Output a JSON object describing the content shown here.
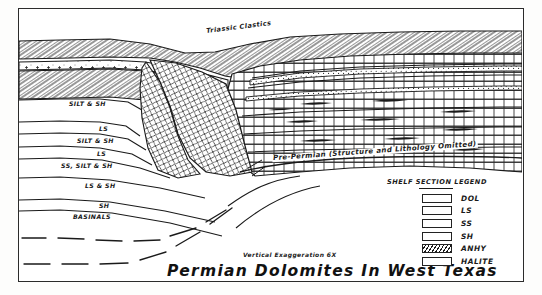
{
  "figure": {
    "title": "Permian Dolomites In West Texas",
    "vertical_exaggeration": "Vertical Exaggeration 6X"
  },
  "annotations": {
    "triassic": "Triassic Clastics",
    "pre_permian": "Pre-Permian (Structure and Lithology Omitted)"
  },
  "basin_units": [
    {
      "label": "SILT & SH",
      "x": 68,
      "y": 104
    },
    {
      "label": "LS",
      "x": 98,
      "y": 130
    },
    {
      "label": "SILT & SH",
      "x": 78,
      "y": 142
    },
    {
      "label": "LS",
      "x": 96,
      "y": 155
    },
    {
      "label": "SS, SILT & SH",
      "x": 62,
      "y": 166
    },
    {
      "label": "LS & SH",
      "x": 84,
      "y": 186
    },
    {
      "label": "SH",
      "x": 98,
      "y": 206
    },
    {
      "label": "BASINALS",
      "x": 74,
      "y": 216
    }
  ],
  "legend": {
    "title": "SHELF SECTION LEGEND",
    "items": [
      {
        "label": "DOL",
        "pattern": "brick-stipple"
      },
      {
        "label": "LS",
        "pattern": "brick-dash"
      },
      {
        "label": "SS",
        "pattern": "stipple-dense"
      },
      {
        "label": "SH",
        "pattern": "horizontal-dash"
      },
      {
        "label": "ANHY",
        "pattern": "diagonal-hatch"
      },
      {
        "label": "HALITE",
        "pattern": "cross-plus"
      }
    ]
  },
  "colors": {
    "ink": "#1a1a1a",
    "paper": "#ffffff",
    "frame": "#2b2b2b"
  }
}
